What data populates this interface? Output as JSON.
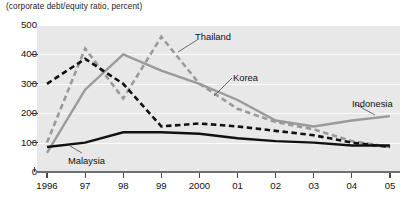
{
  "chart_data": {
    "type": "line",
    "title": "",
    "subtitle": "(corporate debt/equity ratio, percent)",
    "xlabel": "",
    "ylabel": "",
    "unit_caption": "(corporate debt/equity ratio, percent)",
    "categories": [
      "1996",
      "97",
      "98",
      "99",
      "2000",
      "01",
      "02",
      "03",
      "04",
      "05"
    ],
    "x_tick_labels": [
      "1996",
      "97",
      "98",
      "99",
      "2000",
      "01",
      "02",
      "03",
      "04",
      "05"
    ],
    "y_tick_labels": [
      "0",
      "100",
      "200",
      "300",
      "400",
      "500"
    ],
    "y_ticks": [
      0,
      100,
      200,
      300,
      400,
      500
    ],
    "ylim": [
      0,
      500
    ],
    "grid": true,
    "legend_position": "inline-annotations",
    "series": [
      {
        "name": "Thailand",
        "style": "dashed",
        "color": "#9a9a9a",
        "values": [
          100,
          420,
          250,
          460,
          300,
          215,
          170,
          145,
          105,
          85
        ]
      },
      {
        "name": "Korea",
        "style": "dashed",
        "color": "#111111",
        "values": [
          300,
          385,
          300,
          155,
          165,
          155,
          140,
          125,
          100,
          85
        ]
      },
      {
        "name": "Indonesia",
        "style": "solid",
        "color": "#9a9a9a",
        "values": [
          65,
          280,
          400,
          345,
          300,
          245,
          175,
          155,
          175,
          190
        ]
      },
      {
        "name": "Malaysia",
        "style": "solid",
        "color": "#111111",
        "values": [
          85,
          100,
          135,
          135,
          130,
          115,
          105,
          100,
          90,
          90
        ]
      }
    ],
    "annotations": [
      {
        "label": "Thailand",
        "x": 195,
        "y": 31
      },
      {
        "label": "Korea",
        "x": 233,
        "y": 72
      },
      {
        "label": "Indonesia",
        "x": 352,
        "y": 98
      },
      {
        "label": "Malaysia",
        "x": 68,
        "y": 155
      }
    ]
  }
}
